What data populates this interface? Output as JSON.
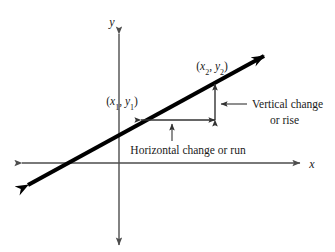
{
  "figure": {
    "axes": {
      "x_label": "x",
      "y_label": "y",
      "origin": [
        119,
        163
      ]
    },
    "points": [
      {
        "id": "p1",
        "label_prefix": "(",
        "x_var": "x",
        "x_sub": "1",
        "comma": ", ",
        "y_var": "y",
        "y_sub": "1",
        "label_suffix": ")",
        "plain": "(x1, y1)",
        "at": [
          141,
          120
        ]
      },
      {
        "id": "p2",
        "label_prefix": "(",
        "x_var": "x",
        "x_sub": "2",
        "comma": ", ",
        "y_var": "y",
        "y_sub": "2",
        "label_suffix": ")",
        "plain": "(x2, y2)",
        "at": [
          215,
          82
        ]
      }
    ],
    "annotations": {
      "vertical": {
        "line1": "Vertical change",
        "line2": "or rise"
      },
      "horizontal": {
        "text": "Horizontal change or run"
      }
    },
    "colors": {
      "line": "#000000",
      "axis": "#4d4d4d",
      "measure": "#333333",
      "text": "#1a1a1a",
      "background": "#ffffff"
    }
  }
}
